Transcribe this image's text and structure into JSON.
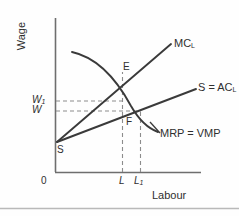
{
  "figure": {
    "type": "economics-diagram",
    "topic": "Monopsony labour market",
    "axes": {
      "y_label": "Wage",
      "x_label": "Labour",
      "origin_label": "0"
    },
    "curves": [
      {
        "key": "mc",
        "label_main": "MC",
        "label_sub": "L",
        "desc": "marginal-cost-of-labour-line"
      },
      {
        "key": "sac",
        "label_main": "S = AC",
        "label_sub": "L",
        "desc": "supply-average-cost-of-labour-line"
      },
      {
        "key": "mrp",
        "label_main": "MRP = VMP",
        "label_sub": "",
        "desc": "marginal-revenue-product-curve"
      }
    ],
    "points": [
      {
        "key": "E",
        "label": "E",
        "desc": "equilibrium-intersection-mc-mrp"
      },
      {
        "key": "F",
        "label": "F",
        "desc": "wage-point-on-supply-curve"
      },
      {
        "key": "S",
        "label": "S",
        "desc": "supply-curve-intercept"
      }
    ],
    "wage_ticks": [
      {
        "key": "W1",
        "main": "W",
        "sub": "1",
        "desc": "competitive-wage"
      },
      {
        "key": "W",
        "main": "W",
        "sub": "",
        "desc": "monopsony-wage"
      }
    ],
    "labour_ticks": [
      {
        "key": "L",
        "main": "L",
        "sub": "",
        "desc": "monopsony-employment"
      },
      {
        "key": "L1",
        "main": "L",
        "sub": "1",
        "desc": "competitive-employment"
      }
    ],
    "colors": {
      "line": "#3a3a3a",
      "axis": "#6e6e6e",
      "dashed": "#8c8c8c",
      "text": "#2f2f2f",
      "background": "#fefefe",
      "rule": "#b9b9b9"
    }
  }
}
